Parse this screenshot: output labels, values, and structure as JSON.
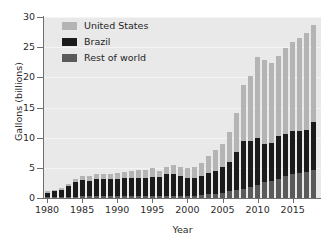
{
  "chart_data": {
    "type": "bar",
    "stacked": true,
    "title": "",
    "xlabel": "Year",
    "ylabel": "Gallons (billions)",
    "ylim": [
      0,
      30
    ],
    "yticks": [
      0,
      5,
      10,
      15,
      20,
      25,
      30
    ],
    "xticks": [
      1980,
      1985,
      1990,
      1995,
      2000,
      2005,
      2010,
      2015
    ],
    "grid": true,
    "legend_position": "top-left",
    "x": [
      1980,
      1981,
      1982,
      1983,
      1984,
      1985,
      1986,
      1987,
      1988,
      1989,
      1990,
      1991,
      1992,
      1993,
      1994,
      1995,
      1996,
      1997,
      1998,
      1999,
      2000,
      2001,
      2002,
      2003,
      2004,
      2005,
      2006,
      2007,
      2008,
      2009,
      2010,
      2011,
      2012,
      2013,
      2014,
      2015,
      2016,
      2017,
      2018
    ],
    "series": [
      {
        "name": "Rest of world",
        "color": "#5a5a5a",
        "values": [
          0.1,
          0.1,
          0.1,
          0.1,
          0.2,
          0.3,
          0.3,
          0.3,
          0.3,
          0.3,
          0.3,
          0.3,
          0.3,
          0.3,
          0.3,
          0.3,
          0.4,
          0.4,
          0.4,
          0.4,
          0.4,
          0.4,
          0.5,
          0.6,
          0.7,
          0.9,
          1.1,
          1.4,
          1.5,
          1.8,
          2.2,
          2.6,
          2.8,
          3.2,
          3.6,
          3.9,
          4.1,
          4.3,
          4.6
        ]
      },
      {
        "name": "Brazil",
        "color": "#1b1b1b",
        "values": [
          0.8,
          1.0,
          1.3,
          1.9,
          2.5,
          2.7,
          2.6,
          2.8,
          2.8,
          2.8,
          2.9,
          3.0,
          3.0,
          3.1,
          3.1,
          3.2,
          3.1,
          3.5,
          3.6,
          3.3,
          2.9,
          3.0,
          3.2,
          3.6,
          3.8,
          4.2,
          4.9,
          6.2,
          7.9,
          7.6,
          7.8,
          6.3,
          6.3,
          7.0,
          7.0,
          7.2,
          7.0,
          7.0,
          8.0
        ]
      },
      {
        "name": "United States",
        "color": "#b4b4b4",
        "values": [
          0.2,
          0.2,
          0.2,
          0.4,
          0.5,
          0.7,
          0.8,
          0.9,
          0.9,
          0.9,
          0.9,
          1.0,
          1.1,
          1.2,
          1.3,
          1.4,
          1.0,
          1.3,
          1.4,
          1.5,
          1.6,
          1.8,
          2.1,
          2.8,
          3.4,
          3.9,
          4.9,
          6.5,
          9.3,
          10.9,
          13.3,
          13.9,
          13.2,
          13.3,
          14.3,
          14.8,
          15.4,
          16.1,
          16.1
        ]
      }
    ],
    "totals": [
      1.1,
      1.3,
      1.6,
      2.4,
      3.2,
      3.7,
      3.7,
      4.0,
      4.0,
      4.0,
      4.1,
      4.3,
      4.4,
      4.6,
      4.7,
      4.9,
      4.5,
      5.2,
      5.4,
      5.2,
      4.9,
      5.2,
      5.8,
      7.0,
      7.9,
      9.0,
      10.9,
      14.1,
      18.7,
      20.3,
      23.3,
      22.8,
      22.3,
      23.5,
      24.9,
      25.9,
      26.5,
      27.4,
      28.7
    ]
  },
  "axes": {
    "ytick_labels": [
      "30",
      "25",
      "20",
      "15",
      "10",
      "5",
      "0"
    ],
    "xtick_labels": [
      "1980",
      "1985",
      "1990",
      "1995",
      "2000",
      "2005",
      "2010",
      "2015"
    ],
    "y_title": "Gallons (billions)",
    "x_title": "Year"
  },
  "legend": {
    "items": [
      {
        "label": "United States",
        "color": "#b4b4b4"
      },
      {
        "label": "Brazil",
        "color": "#1b1b1b"
      },
      {
        "label": "Rest of world",
        "color": "#5a5a5a"
      }
    ]
  }
}
